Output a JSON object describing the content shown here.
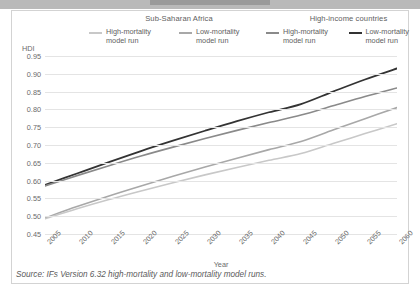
{
  "figure": {
    "source_note": "Source: IFs Version 6.32 high-mortality and low-mortality model runs."
  },
  "chart_data": {
    "type": "line",
    "title": "",
    "xlabel": "Year",
    "ylabel": "HDI",
    "xlim": [
      2005,
      2060
    ],
    "ylim": [
      0.45,
      0.95
    ],
    "grid": true,
    "legend_position": "top",
    "legend_groups": [
      {
        "name": "Sub-Saharan Africa",
        "entries": [
          {
            "label": "High-mortality\nmodel run",
            "label_line1": "High-mortality",
            "label_line2": "model run",
            "color": "#c8c8c8"
          },
          {
            "label": "Low-mortality\nmodel run",
            "label_line1": "Low-mortality",
            "label_line2": "model run",
            "color": "#a8a8a8"
          }
        ]
      },
      {
        "name": "High-income countries",
        "entries": [
          {
            "label": "High-mortality\nmodel run",
            "label_line1": "High-mortality",
            "label_line2": "model run",
            "color": "#8a8a8a"
          },
          {
            "label": "Low-mortality\nmodel run",
            "label_line1": "Low-mortality",
            "label_line2": "model run",
            "color": "#333333"
          }
        ]
      }
    ],
    "x": [
      2005,
      2010,
      2015,
      2020,
      2025,
      2030,
      2035,
      2040,
      2045,
      2050,
      2055,
      2060
    ],
    "xticks": [
      "2005",
      "2010",
      "2015",
      "2020",
      "2025",
      "2030",
      "2035",
      "2040",
      "2045",
      "2050",
      "2055",
      "2060"
    ],
    "yticks": [
      "0.95",
      "0.90",
      "0.85",
      "0.80",
      "0.75",
      "0.70",
      "0.65",
      "0.60",
      "0.55",
      "0.50",
      "0.45"
    ],
    "ytick_values": [
      0.95,
      0.9,
      0.85,
      0.8,
      0.75,
      0.7,
      0.65,
      0.6,
      0.55,
      0.5,
      0.45
    ],
    "series": [
      {
        "name": "High-income countries - Low-mortality model run",
        "group": "High-income countries",
        "run": "Low-mortality",
        "color": "#333333",
        "width": 1.8,
        "values": [
          0.588,
          0.62,
          0.652,
          0.683,
          0.712,
          0.74,
          0.767,
          0.792,
          0.815,
          0.85,
          0.884,
          0.915
        ]
      },
      {
        "name": "High-income countries - High-mortality model run",
        "group": "High-income countries",
        "run": "High-mortality",
        "color": "#8a8a8a",
        "width": 1.6,
        "values": [
          0.585,
          0.614,
          0.642,
          0.669,
          0.694,
          0.718,
          0.741,
          0.763,
          0.784,
          0.81,
          0.836,
          0.86
        ]
      },
      {
        "name": "Sub-Saharan Africa - Low-mortality model run",
        "group": "Sub-Saharan Africa",
        "run": "Low-mortality",
        "color": "#a8a8a8",
        "width": 1.6,
        "values": [
          0.495,
          0.527,
          0.557,
          0.585,
          0.612,
          0.638,
          0.663,
          0.687,
          0.71,
          0.742,
          0.774,
          0.805
        ]
      },
      {
        "name": "Sub-Saharan Africa - High-mortality model run",
        "group": "Sub-Saharan Africa",
        "run": "High-mortality",
        "color": "#c8c8c8",
        "width": 1.6,
        "values": [
          0.493,
          0.521,
          0.547,
          0.571,
          0.594,
          0.616,
          0.637,
          0.657,
          0.676,
          0.704,
          0.732,
          0.76
        ]
      }
    ]
  }
}
